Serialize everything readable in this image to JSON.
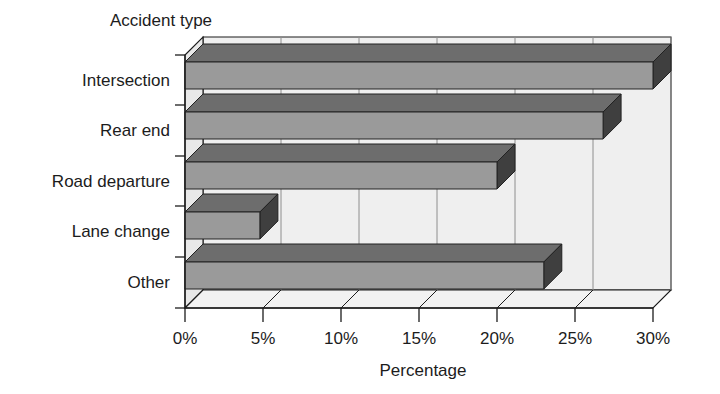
{
  "chart_data": {
    "type": "bar",
    "orientation": "horizontal",
    "style": "3d",
    "title": "",
    "ylabel": "Accident type",
    "xlabel": "Percentage",
    "categories": [
      "Intersection",
      "Rear end",
      "Road departure",
      "Lane change",
      "Other"
    ],
    "values": [
      30,
      26.8,
      20,
      4.8,
      23
    ],
    "value_suffix": "%",
    "xlim": [
      0,
      30
    ],
    "xticks": [
      0,
      5,
      10,
      15,
      20,
      25,
      30
    ],
    "xtick_labels": [
      "0%",
      "5%",
      "10%",
      "15%",
      "20%",
      "25%",
      "30%"
    ],
    "grid": true,
    "legend": null,
    "colors": {
      "bar_face": "#9a9a9a",
      "bar_top": "#6d6d6d",
      "bar_side": "#4a4a4a",
      "plot_floor": "#ebebeb",
      "plot_back": "#efefef",
      "axis_line": "#1c1c1c",
      "grid_line": "#8e8e8e",
      "background": "#ffffff"
    }
  }
}
